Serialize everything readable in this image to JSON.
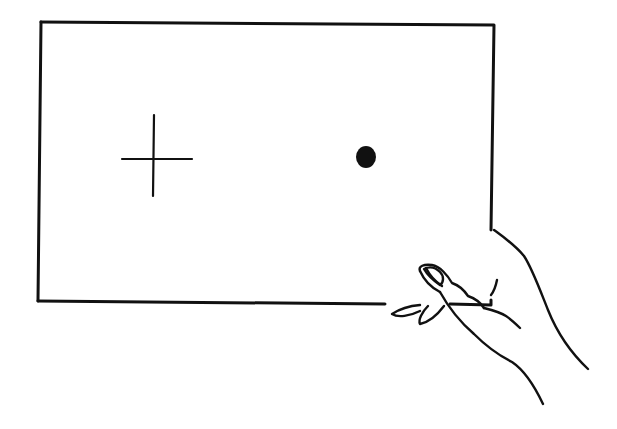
{
  "figure": {
    "background": "#ffffff",
    "ink": "#111111",
    "card": {
      "corners": [
        [
          41,
          22
        ],
        [
          494,
          25
        ],
        [
          491,
          305
        ],
        [
          38,
          301
        ]
      ]
    },
    "cross": {
      "cx": 155,
      "cy": 159,
      "h_from": 122,
      "h_to": 192,
      "v_from": 115,
      "v_to": 196
    },
    "dot": {
      "cx": 366,
      "cy": 157,
      "rx": 10,
      "ry": 11
    },
    "hand": {
      "position": "lower-right",
      "grip": "holding card bottom-right corner"
    }
  }
}
